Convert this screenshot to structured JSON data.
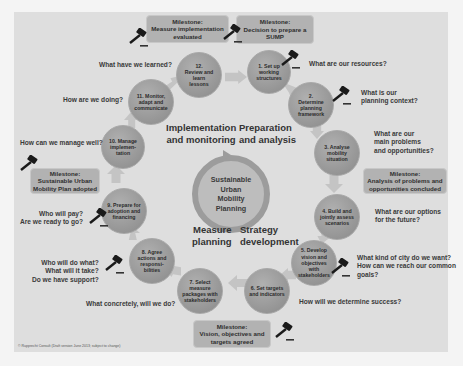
{
  "diagram": {
    "center_label": "Sustainable Urban Mobility Planning",
    "phases": [
      {
        "id": "preparation",
        "label": "Preparation and analysis"
      },
      {
        "id": "strategy",
        "label": "Strategy development"
      },
      {
        "id": "measure",
        "label": "Measure planning"
      },
      {
        "id": "implementation",
        "label": "Implementation and monitoring"
      }
    ],
    "steps": [
      {
        "number": 1,
        "label": "1. Set up working structures",
        "question": "What are our resources?"
      },
      {
        "number": 2,
        "label": "2. Determine planning framework",
        "question": "What is our planning context?"
      },
      {
        "number": 3,
        "label": "3. Analyse mobility situation",
        "question": "What are our main problems and opportunities?"
      },
      {
        "number": 4,
        "label": "4. Build and jointly assess scenarios",
        "question": "What are our options for the future?"
      },
      {
        "number": 5,
        "label": "5. Develop vision and objectives with stakeholders",
        "question": "What kind of city do we want? How can we reach our common goals?"
      },
      {
        "number": 6,
        "label": "6. Set targets and indicators",
        "question": "How will we determine success?"
      },
      {
        "number": 7,
        "label": "7. Select measure packages with stakeholders",
        "question": "What concretely, will we do?"
      },
      {
        "number": 8,
        "label": "8. Agree actions and responsibilities",
        "question": "Who will do what? What will it take? Do we have support?"
      },
      {
        "number": 9,
        "label": "9. Prepare for adoption and financing",
        "question": "Who will pay? Are we ready to go?"
      },
      {
        "number": 10,
        "label": "10. Manage implementation",
        "question": "How can we manage well?"
      },
      {
        "number": 11,
        "label": "11. Monitor, adapt and communicate",
        "question": "How are we doing?"
      },
      {
        "number": 12,
        "label": "12. Review and learn lessons",
        "question": "What have we learned?"
      }
    ],
    "step_text": {
      "s1": [
        "1. Set up",
        "working",
        "structures"
      ],
      "s2": [
        "2.",
        "Determine",
        "planning",
        "framework"
      ],
      "s3": [
        "3. Analyse",
        "mobility",
        "situation"
      ],
      "s4": [
        "4. Build and",
        "jointly assess",
        "scenarios"
      ],
      "s5": [
        "5. Develop",
        "vision and",
        "objectives",
        "with",
        "stakeholders"
      ],
      "s6": [
        "6. Set targets",
        "and indicators"
      ],
      "s7": [
        "7. Select",
        "measure",
        "packages with",
        "stakeholders"
      ],
      "s8": [
        "8. Agree",
        "actions and",
        "responsi-",
        "bilities"
      ],
      "s9": [
        "9. Prepare for",
        "adoption and",
        "financing"
      ],
      "s10": [
        "10. Manage",
        "implemen-",
        "tation"
      ],
      "s11": [
        "11. Monitor,",
        "adapt and",
        "communicate"
      ],
      "s12": [
        "12.",
        "Review and",
        "learn",
        "lessons"
      ]
    },
    "questions": {
      "q1": "What are our resources?",
      "q2a": "What is our",
      "q2b": "planning context?",
      "q3a": "What are our",
      "q3b": "main problems",
      "q3c": "and opportunities?",
      "q4a": "What are our options",
      "q4b": "for the future?",
      "q5a": "What kind of city do we want?",
      "q5b": "How can we reach our common",
      "q5c": "goals?",
      "q6": "How will we determine success?",
      "q7": "What concretely, will we do?",
      "q8a": "Who will do what?",
      "q8b": "What will it take?",
      "q8c": "Do we have support?",
      "q9a": "Who will pay?",
      "q9b": "Are we ready to go?",
      "q10": "How can we manage well?",
      "q11": "How are we doing?",
      "q12": "What have we learned?"
    },
    "milestones": {
      "m1": {
        "title": "Milestone:",
        "line1": "Decision to prepare a",
        "line2": "SUMP"
      },
      "m2": {
        "title": "Milestone:",
        "line1": "Analysis of problems and",
        "line2": "opportunities concluded"
      },
      "m3": {
        "title": "Milestone:",
        "line1": "Vision, objectives and",
        "line2": "targets agreed"
      },
      "m4": {
        "title": "Milestone:",
        "line1": "Sustainable Urban",
        "line2": "Mobility Plan adopted"
      },
      "m5": {
        "title": "Milestone:",
        "line1": "Measure implementation",
        "line2": "evaluated"
      }
    },
    "copyright": "© Rupprecht Consult (Draft version June 2013; subject to change)",
    "colors": {
      "panel_bg": "#dedede",
      "circle": "#959595",
      "arrow": "#c4c4c4",
      "milestone": "#b2b2b2",
      "text": "#333333"
    },
    "icons": {
      "milestone_marker": "gavel-icon",
      "center_cycle": "cycle-arrow-icon"
    }
  }
}
